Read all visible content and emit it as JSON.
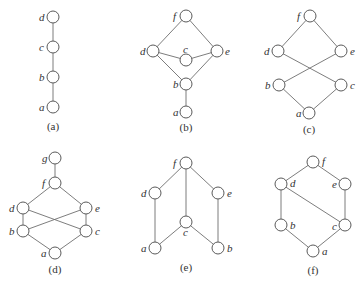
{
  "figure": {
    "node_radius": 6,
    "colors": {
      "edge": "#6e6e6e",
      "node_stroke": "#5a5a5a",
      "text": "#333333",
      "background": "#ffffff"
    },
    "diagrams": [
      {
        "caption": "(a)",
        "caption_pos": [
          53,
          130
        ],
        "nodes": [
          {
            "id": "d",
            "x": 53,
            "y": 17,
            "lx": 39,
            "ly": 21
          },
          {
            "id": "c",
            "x": 53,
            "y": 47,
            "lx": 39,
            "ly": 51
          },
          {
            "id": "b",
            "x": 53,
            "y": 77,
            "lx": 39,
            "ly": 81
          },
          {
            "id": "a",
            "x": 53,
            "y": 107,
            "lx": 39,
            "ly": 111
          }
        ],
        "edges": [
          [
            "d",
            "c"
          ],
          [
            "c",
            "b"
          ],
          [
            "b",
            "a"
          ]
        ]
      },
      {
        "caption": "(b)",
        "caption_pos": [
          186,
          131
        ],
        "nodes": [
          {
            "id": "f",
            "x": 186,
            "y": 16,
            "lx": 173,
            "ly": 20
          },
          {
            "id": "d",
            "x": 153,
            "y": 51,
            "lx": 140,
            "ly": 55
          },
          {
            "id": "c",
            "x": 186,
            "y": 60,
            "lx": 183,
            "ly": 53
          },
          {
            "id": "e",
            "x": 217,
            "y": 51,
            "lx": 225,
            "ly": 55
          },
          {
            "id": "b",
            "x": 186,
            "y": 84,
            "lx": 173,
            "ly": 88
          },
          {
            "id": "a",
            "x": 186,
            "y": 112,
            "lx": 173,
            "ly": 116
          }
        ],
        "edges": [
          [
            "f",
            "d"
          ],
          [
            "f",
            "e"
          ],
          [
            "d",
            "c"
          ],
          [
            "c",
            "e"
          ],
          [
            "d",
            "b"
          ],
          [
            "e",
            "b"
          ],
          [
            "b",
            "a"
          ]
        ]
      },
      {
        "caption": "(c)",
        "caption_pos": [
          309,
          133
        ],
        "nodes": [
          {
            "id": "f",
            "x": 310,
            "y": 16,
            "lx": 297,
            "ly": 20
          },
          {
            "id": "d",
            "x": 278,
            "y": 51,
            "lx": 264,
            "ly": 55
          },
          {
            "id": "e",
            "x": 341,
            "y": 51,
            "lx": 350,
            "ly": 55
          },
          {
            "id": "b",
            "x": 279,
            "y": 85,
            "lx": 265,
            "ly": 89
          },
          {
            "id": "c",
            "x": 341,
            "y": 85,
            "lx": 350,
            "ly": 89
          },
          {
            "id": "a",
            "x": 309,
            "y": 113,
            "lx": 296,
            "ly": 117
          }
        ],
        "edges": [
          [
            "f",
            "d"
          ],
          [
            "f",
            "e"
          ],
          [
            "d",
            "c"
          ],
          [
            "e",
            "b"
          ],
          [
            "b",
            "a"
          ],
          [
            "c",
            "a"
          ]
        ]
      },
      {
        "caption": "(d)",
        "caption_pos": [
          55,
          273
        ],
        "nodes": [
          {
            "id": "g",
            "x": 55,
            "y": 158,
            "lx": 42,
            "ly": 162
          },
          {
            "id": "f",
            "x": 55,
            "y": 183,
            "lx": 42,
            "ly": 187
          },
          {
            "id": "d",
            "x": 23,
            "y": 208,
            "lx": 9,
            "ly": 212
          },
          {
            "id": "e",
            "x": 86,
            "y": 208,
            "lx": 95,
            "ly": 212
          },
          {
            "id": "b",
            "x": 23,
            "y": 231,
            "lx": 9,
            "ly": 235
          },
          {
            "id": "c",
            "x": 86,
            "y": 231,
            "lx": 95,
            "ly": 235
          },
          {
            "id": "a",
            "x": 55,
            "y": 253,
            "lx": 41,
            "ly": 257
          }
        ],
        "edges": [
          [
            "g",
            "f"
          ],
          [
            "f",
            "d"
          ],
          [
            "f",
            "e"
          ],
          [
            "d",
            "b"
          ],
          [
            "e",
            "c"
          ],
          [
            "d",
            "c"
          ],
          [
            "e",
            "b"
          ],
          [
            "b",
            "a"
          ],
          [
            "c",
            "a"
          ]
        ]
      },
      {
        "caption": "(e)",
        "caption_pos": [
          186,
          271
        ],
        "nodes": [
          {
            "id": "f",
            "x": 186,
            "y": 163,
            "lx": 173,
            "ly": 167
          },
          {
            "id": "d",
            "x": 155,
            "y": 193,
            "lx": 141,
            "ly": 197
          },
          {
            "id": "e",
            "x": 218,
            "y": 193,
            "lx": 227,
            "ly": 197
          },
          {
            "id": "c",
            "x": 186,
            "y": 222,
            "lx": 183,
            "ly": 236
          },
          {
            "id": "a",
            "x": 155,
            "y": 248,
            "lx": 141,
            "ly": 252
          },
          {
            "id": "b",
            "x": 218,
            "y": 248,
            "lx": 227,
            "ly": 252
          }
        ],
        "edges": [
          [
            "f",
            "d"
          ],
          [
            "f",
            "e"
          ],
          [
            "f",
            "c"
          ],
          [
            "d",
            "a"
          ],
          [
            "e",
            "b"
          ],
          [
            "c",
            "a"
          ],
          [
            "c",
            "b"
          ]
        ]
      },
      {
        "caption": "(f)",
        "caption_pos": [
          313,
          274
        ],
        "nodes": [
          {
            "id": "f",
            "x": 313,
            "y": 162,
            "lx": 322,
            "ly": 165
          },
          {
            "id": "d",
            "x": 281,
            "y": 184,
            "lx": 290,
            "ly": 187
          },
          {
            "id": "e",
            "x": 345,
            "y": 184,
            "lx": 332,
            "ly": 188
          },
          {
            "id": "b",
            "x": 281,
            "y": 225,
            "lx": 290,
            "ly": 229
          },
          {
            "id": "c",
            "x": 345,
            "y": 225,
            "lx": 332,
            "ly": 230
          },
          {
            "id": "a",
            "x": 313,
            "y": 251,
            "lx": 322,
            "ly": 255
          }
        ],
        "edges": [
          [
            "f",
            "d"
          ],
          [
            "f",
            "e"
          ],
          [
            "d",
            "b"
          ],
          [
            "e",
            "c"
          ],
          [
            "d",
            "c"
          ],
          [
            "b",
            "a"
          ],
          [
            "c",
            "a"
          ]
        ]
      }
    ]
  }
}
